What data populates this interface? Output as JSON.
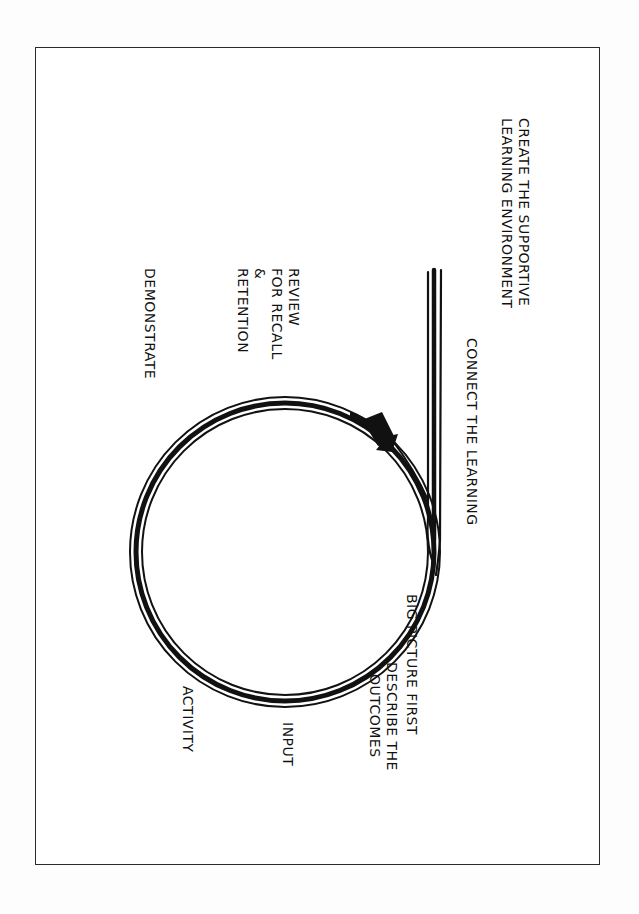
{
  "diagram": {
    "orientation": "rotated 90 degrees clockwise",
    "colors": {
      "ink": "#111111",
      "paper": "#ffffff",
      "frame": "#2a2a2a"
    },
    "labels": {
      "create_env_line1": "CREATE THE SUPPORTIVE",
      "create_env_line2": "LEARNING ENVIRONMENT",
      "connect": "CONNECT THE LEARNING",
      "big_picture": "BIG PICTURE FIRST",
      "describe_line1": "DESCRIBE THE",
      "describe_line2": "OUTCOMES",
      "input": "INPUT",
      "activity": "ACTIVITY",
      "demonstrate": "DEMONSTRATE",
      "review_line1": "REVIEW",
      "review_line2": "FOR RECALL",
      "review_line3": "&",
      "review_line4": "RETENTION"
    },
    "cycle_order": [
      "Create the supportive learning environment",
      "Connect the learning",
      "Big picture first",
      "Describe the outcomes",
      "Input",
      "Activity",
      "Demonstrate",
      "Review for recall & retention"
    ],
    "shapes": {
      "entry_line": "triple vertical line entering the loop",
      "loop": "triple-line circle",
      "arrow": "arrowhead near top of circle indicating cycle direction"
    }
  }
}
